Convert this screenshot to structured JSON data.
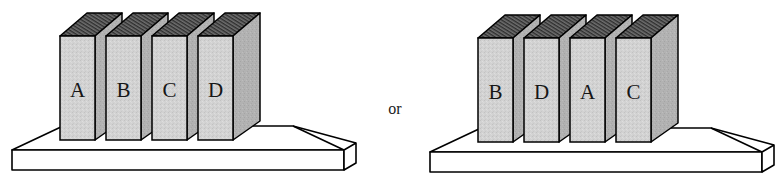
{
  "figure": {
    "kind": "line-drawing",
    "background_color": "#ffffff",
    "ink_color": "#000000"
  },
  "conjunction": {
    "label": "or"
  },
  "colors": {
    "book_front": "#d2d2d2",
    "book_side": "#b2b2b2",
    "book_top_pages": "#4a4a4a",
    "book_top_cover": "#7a7a7a",
    "platform_top": "#ffffff",
    "platform_front": "#ffffff",
    "platform_side": "#ffffff",
    "outline": "#000000",
    "letter": "#161616"
  },
  "shelves": [
    {
      "id": "shelf-left",
      "name": "first-arrangement",
      "order_label": "A B C D",
      "books": [
        {
          "label": "A",
          "position": 1
        },
        {
          "label": "B",
          "position": 2
        },
        {
          "label": "C",
          "position": 3
        },
        {
          "label": "D",
          "position": 4
        }
      ]
    },
    {
      "id": "shelf-right",
      "name": "second-arrangement",
      "order_label": "B D A C",
      "books": [
        {
          "label": "B",
          "position": 1
        },
        {
          "label": "D",
          "position": 2
        },
        {
          "label": "A",
          "position": 3
        },
        {
          "label": "C",
          "position": 4
        }
      ]
    }
  ]
}
